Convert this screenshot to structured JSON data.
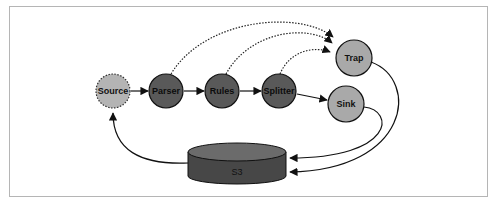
{
  "diagram": {
    "nodes": [
      {
        "id": "source",
        "label": "Source",
        "fill": "#b4b4b4",
        "border": "dotted"
      },
      {
        "id": "parser",
        "label": "Parser",
        "fill": "#595959",
        "border": "solid"
      },
      {
        "id": "rules",
        "label": "Rules",
        "fill": "#595959",
        "border": "solid"
      },
      {
        "id": "splitter",
        "label": "Splitter",
        "fill": "#595959",
        "border": "solid"
      },
      {
        "id": "trap",
        "label": "Trap",
        "fill": "#a9a9a9",
        "border": "solid"
      },
      {
        "id": "sink",
        "label": "Sink",
        "fill": "#a9a9a9",
        "border": "solid"
      },
      {
        "id": "s3",
        "label": "S3",
        "shape": "cylinder",
        "fill": "#474747",
        "top_fill": "#6b6b6b"
      }
    ],
    "edges": [
      {
        "from": "source",
        "to": "parser",
        "style": "solid"
      },
      {
        "from": "parser",
        "to": "rules",
        "style": "solid"
      },
      {
        "from": "rules",
        "to": "splitter",
        "style": "solid"
      },
      {
        "from": "splitter",
        "to": "sink",
        "style": "solid"
      },
      {
        "from": "parser",
        "to": "trap",
        "style": "dotted"
      },
      {
        "from": "rules",
        "to": "trap",
        "style": "dotted"
      },
      {
        "from": "splitter",
        "to": "trap",
        "style": "dotted"
      },
      {
        "from": "trap",
        "to": "s3",
        "style": "solid"
      },
      {
        "from": "sink",
        "to": "s3",
        "style": "solid"
      },
      {
        "from": "s3",
        "to": "source",
        "style": "solid"
      }
    ]
  }
}
